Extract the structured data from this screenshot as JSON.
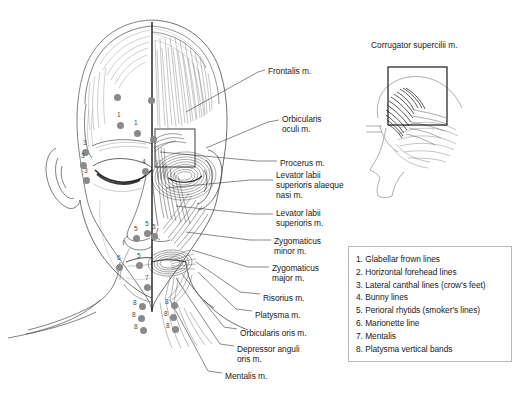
{
  "figure": {
    "title_inset": "Corrugator supercilii m.",
    "muscle_labels": [
      {
        "text": "Frontalis m.",
        "x": 268,
        "y": 66
      },
      {
        "text": "Orbicularis\noculi m.",
        "x": 282,
        "y": 114
      },
      {
        "text": "Procerus m.",
        "x": 280,
        "y": 158
      },
      {
        "text": "Levator labii\nsuperioris alaeque\nnasi m.",
        "x": 276,
        "y": 170
      },
      {
        "text": "Levator labii\nsuperioris m.",
        "x": 276,
        "y": 208
      },
      {
        "text": "Zygomaticus\nminor m.",
        "x": 274,
        "y": 236
      },
      {
        "text": "Zygomaticus\nmajor m.",
        "x": 272,
        "y": 263
      },
      {
        "text": "Risorius m.",
        "x": 263,
        "y": 293
      },
      {
        "text": "Platysma m.",
        "x": 255,
        "y": 310
      },
      {
        "text": "Orbicularis oris m.",
        "x": 240,
        "y": 328
      },
      {
        "text": "Depressor anguli\noris m.",
        "x": 237,
        "y": 344
      },
      {
        "text": "Mentalis m.",
        "x": 225,
        "y": 371
      }
    ],
    "injection_points": [
      {
        "label": "",
        "x": 117,
        "y": 97,
        "num_dx": 0,
        "num_dy": 0
      },
      {
        "label": "",
        "x": 151,
        "y": 100,
        "num_dx": 0,
        "num_dy": 0
      },
      {
        "label": "1",
        "x": 120,
        "y": 125,
        "num_dx": -2,
        "num_dy": -11
      },
      {
        "label": "1",
        "x": 137,
        "y": 133,
        "num_dx": -2,
        "num_dy": -11
      },
      {
        "label": "",
        "x": 153,
        "y": 139,
        "num_dx": 0,
        "num_dy": 0
      },
      {
        "label": "3",
        "x": 85,
        "y": 152,
        "num_dx": -1,
        "num_dy": -10
      },
      {
        "label": "3",
        "x": 83,
        "y": 165,
        "num_dx": -1,
        "num_dy": -10
      },
      {
        "label": "3",
        "x": 86,
        "y": 180,
        "num_dx": -1,
        "num_dy": -10
      },
      {
        "label": "4",
        "x": 145,
        "y": 171,
        "num_dx": -2,
        "num_dy": -10
      },
      {
        "label": "5",
        "x": 136,
        "y": 238,
        "num_dx": -1,
        "num_dy": -10
      },
      {
        "label": "5",
        "x": 147,
        "y": 233,
        "num_dx": -1,
        "num_dy": -10
      },
      {
        "label": "5",
        "x": 154,
        "y": 236,
        "num_dx": -1,
        "num_dy": -10
      },
      {
        "label": "6",
        "x": 119,
        "y": 267,
        "num_dx": -1,
        "num_dy": -10
      },
      {
        "label": "5",
        "x": 139,
        "y": 265,
        "num_dx": -1,
        "num_dy": -10
      },
      {
        "label": "7",
        "x": 147,
        "y": 287,
        "num_dx": -1,
        "num_dy": -10
      },
      {
        "label": "8",
        "x": 142,
        "y": 306,
        "num_dx": -8,
        "num_dy": -4
      },
      {
        "label": "8",
        "x": 141,
        "y": 318,
        "num_dx": -8,
        "num_dy": -4
      },
      {
        "label": "8",
        "x": 143,
        "y": 330,
        "num_dx": -8,
        "num_dy": -4
      },
      {
        "label": "8",
        "x": 174,
        "y": 305,
        "num_dx": -8,
        "num_dy": -4
      },
      {
        "label": "8",
        "x": 173,
        "y": 317,
        "num_dx": -8,
        "num_dy": -4
      },
      {
        "label": "8",
        "x": 175,
        "y": 329,
        "num_dx": -8,
        "num_dy": -4
      }
    ],
    "dot_color": "#8a8a8a"
  },
  "legend": {
    "items": [
      {
        "num": "1.",
        "text": "Glabellar frown lines"
      },
      {
        "num": "2.",
        "text": "Horizontal forehead lines"
      },
      {
        "num": "3.",
        "text": "Lateral canthal lines (crow's feet)"
      },
      {
        "num": "4.",
        "text": "Bunny lines"
      },
      {
        "num": "5.",
        "text": "Perioral rhytids (smoker's lines)"
      },
      {
        "num": "6.",
        "text": "Marionette line"
      },
      {
        "num": "7.",
        "text": "Mentalis"
      },
      {
        "num": "8.",
        "text": "Platysma vertical bands"
      }
    ],
    "border_color": "#b8b8b8"
  }
}
